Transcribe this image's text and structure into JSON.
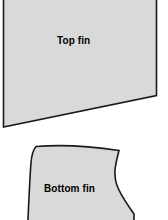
{
  "canvas": {
    "width": 168,
    "height": 220,
    "background_color": "#ffffff"
  },
  "style": {
    "shape_fill": "#d9d9d9",
    "shape_stroke": "#1a1a1a",
    "stroke_width": 1.6,
    "label_color": "#000000"
  },
  "shapes": {
    "top_fin": {
      "label": "Top fin",
      "kind": "quadrilateral",
      "note": "cropped at top image edge",
      "path": "M 3.5 -14 L 156.5 -14 L 156.5 95.5 L 3.5 127 Z"
    },
    "bottom_fin": {
      "label": "Bottom fin",
      "kind": "curved-polygon",
      "note": "cropped at bottom image edge",
      "path": "M 36 146.5 C 62 144.5 96 147 119 150.5 C 116 162 113 173 116.5 184 C 120 195 128 205 134 214 L 134 236 L 27 236 C 28.5 214 29.5 180 31 163 C 31.6 155 33 150 36 146.5 Z"
    }
  }
}
